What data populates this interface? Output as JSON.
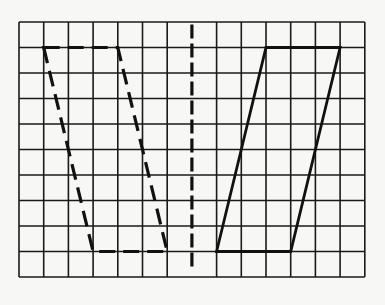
{
  "figure": {
    "type": "grid-diagram",
    "grid": {
      "columns": 14,
      "rows": 10,
      "origin_px": [
        19,
        22
      ],
      "cell_width_px": 24.7,
      "cell_height_px": 25.5,
      "line_color": "#1a1a1a"
    },
    "axis_line": {
      "style": "dashed",
      "grid_x": 7,
      "grid_y_start": 0.1,
      "grid_y_end": 9.7,
      "color": "#111111"
    },
    "shapes": [
      {
        "name": "dashed-parallelogram",
        "style": "dashed",
        "color": "#111111",
        "vertices_grid": [
          [
            1,
            1
          ],
          [
            4,
            1
          ],
          [
            6,
            9
          ],
          [
            3,
            9
          ]
        ]
      },
      {
        "name": "solid-parallelogram",
        "style": "solid",
        "color": "#111111",
        "vertices_grid": [
          [
            10,
            1
          ],
          [
            13,
            1
          ],
          [
            11,
            9
          ],
          [
            8,
            9
          ]
        ]
      }
    ],
    "background_color": "#f7f7f5"
  }
}
